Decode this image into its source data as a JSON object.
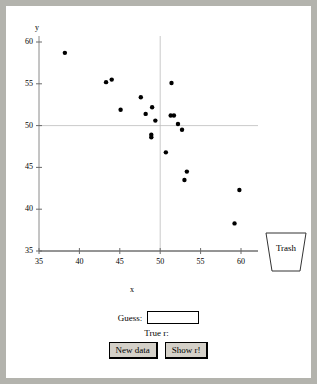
{
  "window": {
    "background_color": "#b3b3ad",
    "panel_color": "#ffffff"
  },
  "trash": {
    "label": "Trash",
    "icon": "trash-can-icon"
  },
  "controls": {
    "guess_label": "Guess:",
    "guess_value": "",
    "guess_placeholder": "",
    "true_r_label": "True r:",
    "true_r_value": "",
    "new_data_label": "New data",
    "show_r_label": "Show r!"
  },
  "chart_data": {
    "type": "scatter",
    "title": "",
    "xlabel": "x",
    "ylabel": "y",
    "xlim": [
      35,
      60
    ],
    "ylim": [
      35,
      60
    ],
    "xticks": [
      35,
      40,
      45,
      50,
      55,
      60
    ],
    "yticks": [
      35,
      40,
      45,
      50,
      55,
      60
    ],
    "grid": true,
    "gridlines": {
      "x": [
        50
      ],
      "y": [
        50
      ]
    },
    "legend": "none",
    "marker_color": "#000000",
    "marker_size": 3,
    "points": [
      {
        "x": 38.2,
        "y": 58.7
      },
      {
        "x": 43.3,
        "y": 55.2
      },
      {
        "x": 44.0,
        "y": 55.5
      },
      {
        "x": 45.1,
        "y": 51.9
      },
      {
        "x": 47.6,
        "y": 53.4
      },
      {
        "x": 48.2,
        "y": 51.4
      },
      {
        "x": 49.0,
        "y": 52.2
      },
      {
        "x": 49.4,
        "y": 50.6
      },
      {
        "x": 48.9,
        "y": 48.9
      },
      {
        "x": 48.9,
        "y": 48.6
      },
      {
        "x": 51.4,
        "y": 55.1
      },
      {
        "x": 51.3,
        "y": 51.2
      },
      {
        "x": 51.7,
        "y": 51.2
      },
      {
        "x": 52.2,
        "y": 50.2
      },
      {
        "x": 52.7,
        "y": 49.5
      },
      {
        "x": 50.7,
        "y": 46.8
      },
      {
        "x": 53.3,
        "y": 44.5
      },
      {
        "x": 53.0,
        "y": 43.5
      },
      {
        "x": 59.8,
        "y": 42.3
      },
      {
        "x": 59.2,
        "y": 38.3
      }
    ]
  }
}
